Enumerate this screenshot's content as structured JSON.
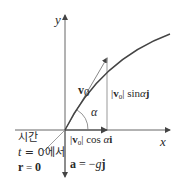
{
  "diagram": {
    "axes": {
      "x_label": "x",
      "y_label": "y"
    },
    "vectors": {
      "initial_velocity": {
        "symbol": "v",
        "subscript": "0"
      },
      "horizontal_component": {
        "bar_open": "|",
        "symbol": "v",
        "subscript": "0",
        "bar_close": "|",
        "func": "cos",
        "angle": "α",
        "unit": "i"
      },
      "vertical_component": {
        "bar_open": "|",
        "symbol": "v",
        "subscript": "0",
        "bar_close": "|",
        "func": "sin",
        "angle": "α",
        "unit": "j"
      },
      "acceleration": {
        "lhs": "a",
        "eq": " = −",
        "g": "g",
        "unit": "j"
      }
    },
    "angle_label": "α",
    "initial_condition": {
      "line1": "시간",
      "line2_var": "t",
      "line2_rest": " = 0에서",
      "line3_lhs": "r",
      "line3_rest": " = ",
      "line3_zero": "0"
    },
    "colors": {
      "axis": "#555555",
      "curve": "#3a3a3a",
      "vector": "#777777",
      "text": "#2a2a2a"
    }
  }
}
